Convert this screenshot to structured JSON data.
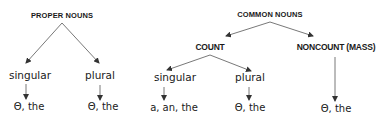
{
  "diagram": {
    "proper": {
      "title": "PROPER NOUNS",
      "singular": {
        "label": "singular",
        "articles": "Θ, the"
      },
      "plural": {
        "label": "plural",
        "articles": "Θ, the"
      }
    },
    "common": {
      "title": "COMMON NOUNS",
      "count": {
        "title": "COUNT",
        "singular": {
          "label": "singular",
          "articles": "a, an, the"
        },
        "plural": {
          "label": "plural",
          "articles": "Θ, the"
        }
      },
      "noncount": {
        "title": "NONCOUNT (MASS)",
        "articles": "Θ, the"
      }
    },
    "colors": {
      "text": "#1a1a1a",
      "lines": "#555555"
    }
  }
}
